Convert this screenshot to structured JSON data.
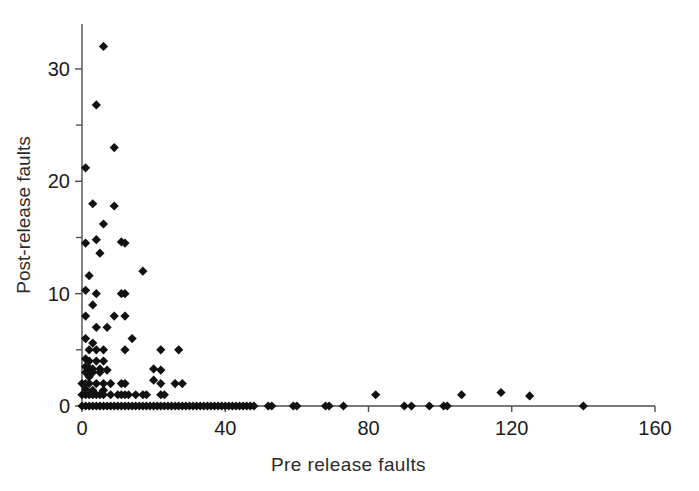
{
  "chart_data": {
    "type": "scatter",
    "title": "",
    "xlabel": "Pre release faults",
    "ylabel": "Post-release faults",
    "xlim": [
      0,
      160
    ],
    "ylim": [
      0,
      34
    ],
    "grid": false,
    "legend": "none",
    "marker": "filled-diamond",
    "marker_color": "#111111",
    "xticks": [
      0,
      40,
      80,
      120,
      160
    ],
    "xtick_labels": [
      "0",
      "40",
      "80",
      "120",
      "160"
    ],
    "yticks": [
      0,
      10,
      20,
      30
    ],
    "ytick_labels": [
      "0",
      "10",
      "20",
      "30"
    ],
    "y_minor_ticks": [
      5,
      15,
      25
    ],
    "points": [
      [
        6,
        32
      ],
      [
        4,
        26.8
      ],
      [
        9,
        23
      ],
      [
        1,
        21.2
      ],
      [
        3,
        18
      ],
      [
        9,
        17.8
      ],
      [
        6,
        16.2
      ],
      [
        4,
        14.8
      ],
      [
        1,
        14.5
      ],
      [
        11,
        14.6
      ],
      [
        12,
        14.5
      ],
      [
        5,
        13.6
      ],
      [
        17,
        12
      ],
      [
        2,
        11.6
      ],
      [
        1,
        10.3
      ],
      [
        4,
        10
      ],
      [
        11,
        10
      ],
      [
        12,
        10
      ],
      [
        3,
        9
      ],
      [
        1,
        8
      ],
      [
        9,
        8
      ],
      [
        12,
        8
      ],
      [
        4,
        7
      ],
      [
        7,
        7
      ],
      [
        14,
        6
      ],
      [
        1,
        6
      ],
      [
        3,
        5.6
      ],
      [
        2,
        5
      ],
      [
        4,
        5
      ],
      [
        6,
        5
      ],
      [
        12,
        5
      ],
      [
        22,
        5
      ],
      [
        27,
        5
      ],
      [
        1,
        4.2
      ],
      [
        2,
        4
      ],
      [
        4,
        4
      ],
      [
        6,
        4
      ],
      [
        1,
        3.5
      ],
      [
        2,
        3.4
      ],
      [
        3,
        3.3
      ],
      [
        5,
        3.3
      ],
      [
        7,
        3.2
      ],
      [
        20,
        3.3
      ],
      [
        22,
        3.2
      ],
      [
        1,
        3
      ],
      [
        3,
        3
      ],
      [
        5,
        3
      ],
      [
        2,
        2.6
      ],
      [
        20,
        2.3
      ],
      [
        0,
        2
      ],
      [
        1,
        2
      ],
      [
        2,
        2
      ],
      [
        4,
        2
      ],
      [
        6,
        2
      ],
      [
        8,
        2
      ],
      [
        11,
        2
      ],
      [
        12,
        2
      ],
      [
        22,
        2
      ],
      [
        26,
        2
      ],
      [
        28,
        2
      ],
      [
        1,
        1.5
      ],
      [
        3,
        1.4
      ],
      [
        6,
        1.4
      ],
      [
        0,
        1
      ],
      [
        1,
        1
      ],
      [
        2,
        1
      ],
      [
        3,
        1
      ],
      [
        4,
        1
      ],
      [
        5,
        1
      ],
      [
        6,
        1
      ],
      [
        8,
        1
      ],
      [
        10,
        1
      ],
      [
        11,
        1
      ],
      [
        12,
        1
      ],
      [
        13,
        1
      ],
      [
        15,
        1
      ],
      [
        17,
        1
      ],
      [
        18,
        1
      ],
      [
        22,
        1
      ],
      [
        23,
        1
      ],
      [
        82,
        1
      ],
      [
        106,
        1
      ],
      [
        117,
        1.2
      ],
      [
        125,
        0.9
      ],
      [
        0,
        0
      ],
      [
        1,
        0
      ],
      [
        2,
        0
      ],
      [
        3,
        0
      ],
      [
        4,
        0
      ],
      [
        5,
        0
      ],
      [
        6,
        0
      ],
      [
        7,
        0
      ],
      [
        8,
        0
      ],
      [
        9,
        0
      ],
      [
        10,
        0
      ],
      [
        11,
        0
      ],
      [
        12,
        0
      ],
      [
        13,
        0
      ],
      [
        14,
        0
      ],
      [
        15,
        0
      ],
      [
        16,
        0
      ],
      [
        17,
        0
      ],
      [
        18,
        0
      ],
      [
        19,
        0
      ],
      [
        20,
        0
      ],
      [
        21,
        0
      ],
      [
        22,
        0
      ],
      [
        23,
        0
      ],
      [
        24,
        0
      ],
      [
        25,
        0
      ],
      [
        26,
        0
      ],
      [
        27,
        0
      ],
      [
        28,
        0
      ],
      [
        29,
        0
      ],
      [
        30,
        0
      ],
      [
        31,
        0
      ],
      [
        32,
        0
      ],
      [
        33,
        0
      ],
      [
        34,
        0
      ],
      [
        35,
        0
      ],
      [
        36,
        0
      ],
      [
        37,
        0
      ],
      [
        38,
        0
      ],
      [
        39,
        0
      ],
      [
        40,
        0
      ],
      [
        41,
        0
      ],
      [
        42,
        0
      ],
      [
        43,
        0
      ],
      [
        44,
        0
      ],
      [
        45,
        0
      ],
      [
        46,
        0
      ],
      [
        47,
        0
      ],
      [
        48,
        0
      ],
      [
        52,
        0
      ],
      [
        53,
        0
      ],
      [
        59,
        0
      ],
      [
        60,
        0
      ],
      [
        68,
        0
      ],
      [
        69,
        0
      ],
      [
        73,
        0
      ],
      [
        90,
        0
      ],
      [
        92,
        0
      ],
      [
        97,
        0
      ],
      [
        101,
        0
      ],
      [
        102,
        0
      ],
      [
        140,
        0
      ]
    ]
  }
}
